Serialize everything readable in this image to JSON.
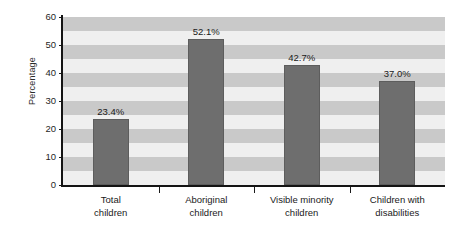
{
  "chart_data": {
    "type": "bar",
    "title": "",
    "subtitle": "",
    "xlabel": "",
    "ylabel": "Percentage",
    "ylim": [
      0,
      60
    ],
    "yticks": [
      0,
      10,
      20,
      30,
      40,
      50,
      60
    ],
    "ytick_labels": [
      "0",
      "10",
      "20",
      "30",
      "40",
      "50",
      "60"
    ],
    "grid": false,
    "background_bands": true,
    "band_step": 5,
    "legend": null,
    "categories": [
      "Total children",
      "Aboriginal children",
      "Visible minority children",
      "Children with disabilities"
    ],
    "category_lines": [
      [
        "Total",
        "children"
      ],
      [
        "Aboriginal",
        "children"
      ],
      [
        "Visible minority",
        "children"
      ],
      [
        "Children with",
        "disabilities"
      ]
    ],
    "values": [
      23.4,
      52.1,
      42.7,
      37.0
    ],
    "data_labels": [
      "23.4%",
      "52.1%",
      "42.7%",
      "37.0%"
    ],
    "colors": {
      "bar": "#6e6e6e",
      "bar_edge": "#5d5d5d",
      "band_dark": "#c9c9c9",
      "band_light": "#efefef",
      "axis": "#141414",
      "text": "#1a1a1a",
      "background": "#ffffff"
    }
  }
}
